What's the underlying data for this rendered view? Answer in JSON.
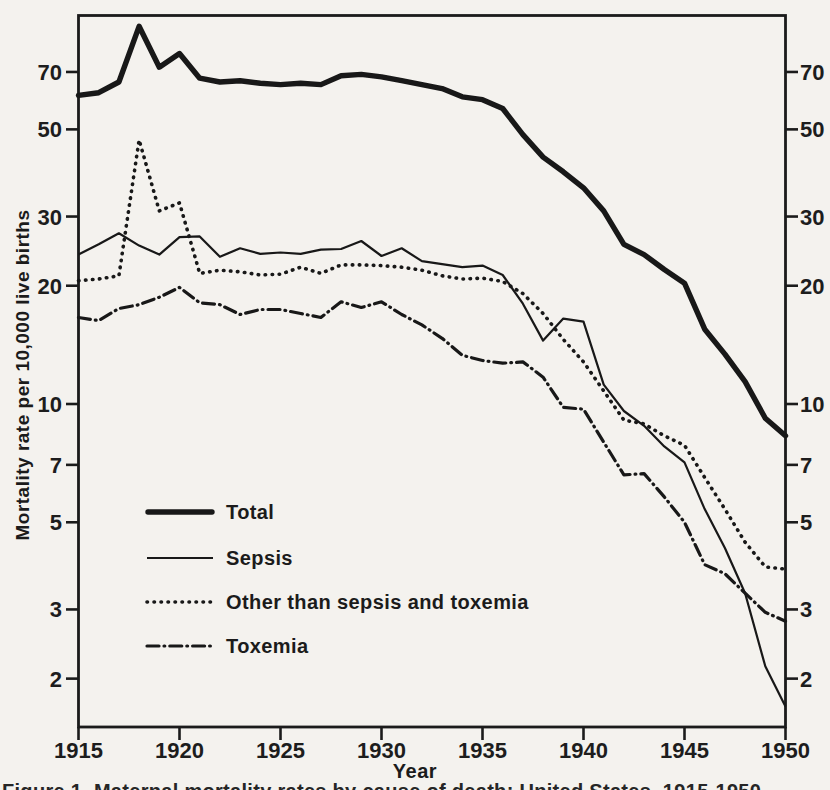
{
  "figure": {
    "y_axis_title": "Mortality rate per 10,000 live births",
    "x_axis_title": "Year",
    "caption_fragment": "Figure 1. Maternal mortality rates by cause of death: United States, 1915-1950",
    "colors": {
      "ink": "#1b1b1b",
      "paper": "#f4f2ee"
    }
  },
  "chart_data": {
    "type": "line",
    "title": "",
    "xlabel": "Year",
    "ylabel": "Mortality rate per 10,000 live births",
    "y_scale": "log",
    "grid": false,
    "legend_position": "inside lower-left",
    "x_range": [
      1915,
      1950
    ],
    "y_range_displayed": [
      1.5,
      97
    ],
    "x_ticks": [
      1915,
      1920,
      1925,
      1930,
      1935,
      1940,
      1945,
      1950
    ],
    "y_ticks": [
      2,
      3,
      5,
      7,
      10,
      20,
      30,
      50,
      70
    ],
    "x": [
      1915,
      1916,
      1917,
      1918,
      1919,
      1920,
      1921,
      1922,
      1923,
      1924,
      1925,
      1926,
      1927,
      1928,
      1929,
      1930,
      1931,
      1932,
      1933,
      1934,
      1935,
      1936,
      1937,
      1938,
      1939,
      1940,
      1941,
      1942,
      1943,
      1944,
      1945,
      1946,
      1947,
      1948,
      1949,
      1950
    ],
    "series": [
      {
        "name": "Total",
        "key": "total",
        "style": "solid-thick",
        "values": [
          61,
          62,
          66,
          91.5,
          72,
          78,
          67.5,
          66,
          66.5,
          65.5,
          65,
          65.5,
          65,
          68.5,
          69,
          68,
          66.5,
          65,
          63.5,
          60.5,
          59.5,
          56.5,
          48.5,
          42.5,
          39,
          35.5,
          31,
          25.5,
          24,
          22,
          20.3,
          15.5,
          13.4,
          11.4,
          9.2,
          8.3
        ]
      },
      {
        "name": "Sepsis",
        "key": "sepsis",
        "style": "solid-thin",
        "values": [
          24,
          25.5,
          27.2,
          25.3,
          24,
          26.6,
          26.7,
          23.7,
          24.9,
          24.1,
          24.3,
          24.1,
          24.7,
          24.8,
          26,
          23.8,
          24.9,
          23.1,
          22.7,
          22.3,
          22.5,
          21.3,
          18,
          14.5,
          16.5,
          16.2,
          11.2,
          9.6,
          8.8,
          7.8,
          7.1,
          5.4,
          4.3,
          3.3,
          2.15,
          1.7
        ]
      },
      {
        "name": "Other than sepsis and toxemia",
        "key": "other",
        "style": "dotted",
        "values": [
          20.6,
          20.8,
          21.2,
          47,
          31,
          32.5,
          21.5,
          21.9,
          21.7,
          21.3,
          21.4,
          22.3,
          21.5,
          22.6,
          22.6,
          22.5,
          22.3,
          21.9,
          21.2,
          20.8,
          20.9,
          20.5,
          19.1,
          17,
          14.6,
          12.8,
          10.8,
          9.1,
          8.9,
          8.3,
          7.85,
          6.5,
          5.4,
          4.45,
          3.85,
          3.8
        ]
      },
      {
        "name": "Toxemia",
        "key": "toxemia",
        "style": "dashdot",
        "values": [
          16.6,
          16.3,
          17.5,
          17.9,
          18.7,
          19.8,
          18.1,
          17.9,
          16.9,
          17.4,
          17.4,
          17,
          16.6,
          18.2,
          17.6,
          18.2,
          16.9,
          15.9,
          14.7,
          13.3,
          12.9,
          12.7,
          12.8,
          11.7,
          9.8,
          9.7,
          8,
          6.6,
          6.65,
          5.8,
          5,
          3.9,
          3.7,
          3.3,
          2.95,
          2.8
        ]
      }
    ]
  }
}
